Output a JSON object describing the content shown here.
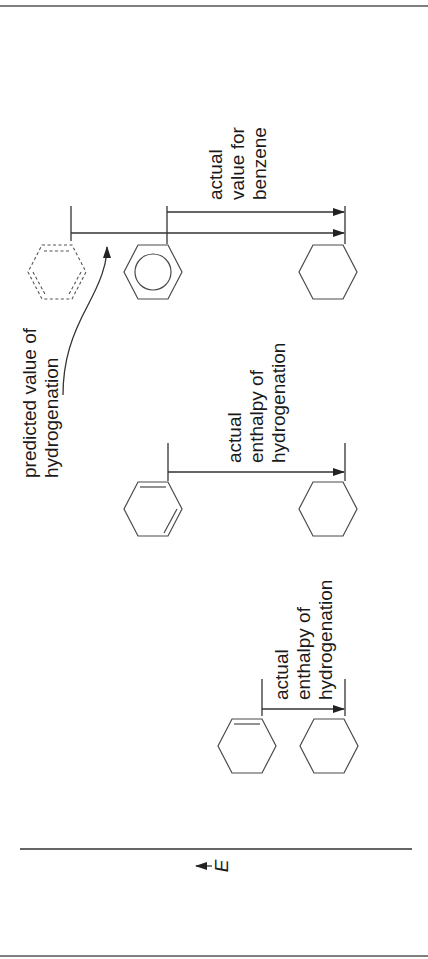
{
  "figure": {
    "axis": {
      "label": "E",
      "direction_arrow": "increasing energy"
    },
    "colors": {
      "line": "#333333",
      "text": "#1a1a1a",
      "background": "#ffffff"
    }
  },
  "groups": [
    {
      "id": "cyclohexene",
      "start_molecule": "cyclohexene",
      "end_molecule": "cyclohexane",
      "label_lines": [
        "actual",
        "enthalpy of",
        "hydrogenation"
      ]
    },
    {
      "id": "cyclohexadiene",
      "start_molecule": "1,3-cyclohexadiene",
      "end_molecule": "cyclohexane",
      "label_lines": [
        "actual",
        "enthalpy of",
        "hydrogenation"
      ]
    },
    {
      "id": "benzene",
      "start_molecule": "benzene",
      "hypothetical_molecule": "cyclohexatriene (dashed)",
      "end_molecule": "cyclohexane",
      "label_lines": [
        "actual",
        "value for",
        "benzene"
      ],
      "predicted_label_lines": [
        "predicted value of",
        "hydrogenation"
      ]
    }
  ]
}
